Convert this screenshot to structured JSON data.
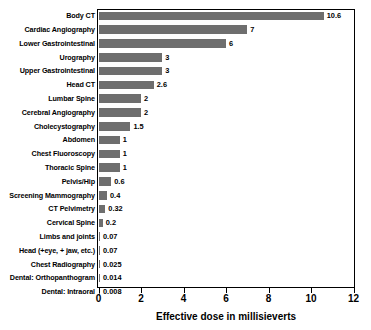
{
  "chart_data": {
    "type": "bar",
    "orientation": "horizontal",
    "title": "",
    "xlabel": "Effective dose in millisieverts",
    "ylabel": "",
    "xlim": [
      0,
      12
    ],
    "xticks": [
      0,
      2,
      4,
      6,
      8,
      10,
      12
    ],
    "xtick_labels": [
      "0",
      "2",
      "4",
      "6",
      "8",
      "10",
      "12"
    ],
    "grid": false,
    "legend": null,
    "bar_color": "#6e6e6e",
    "frame_color": "#000000",
    "categories": [
      "Body CT",
      "Cardiac Angiography",
      "Lower Gastrointestinal",
      "Urography",
      "Upper Gastrointestinal",
      "Head CT",
      "Lumbar Spine",
      "Cerebral Angiography",
      "Cholecystography",
      "Abdomen",
      "Chest Fluoroscopy",
      "Thoracic Spine",
      "Pelvis/Hip",
      "Screening Mammography",
      "CT Pelvimetry",
      "Cervical Spine",
      "Limbs and joints",
      "Head (+eye, + jaw, etc.)",
      "Chest Radiography",
      "Dental: Orthopanthogram",
      "Dental: Intraoral"
    ],
    "values": [
      10.6,
      7,
      6,
      3,
      3,
      2.6,
      2,
      2,
      1.5,
      1,
      1,
      1,
      0.6,
      0.4,
      0.32,
      0.2,
      0.07,
      0.07,
      0.025,
      0.014,
      0.008
    ],
    "value_labels": [
      "10.6",
      "7",
      "6",
      "3",
      "3",
      "2.6",
      "2",
      "2",
      "1.5",
      "1",
      "1",
      "1",
      "0.6",
      "0.4",
      "0.32",
      "0.2",
      "0.07",
      "0.07",
      "0.025",
      "0.014",
      "0.008"
    ]
  }
}
